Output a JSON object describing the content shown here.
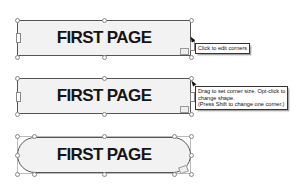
{
  "shapes": [
    {
      "label": "FIRST PAGE",
      "corner_style": "square",
      "state": "hover-corner-handle"
    },
    {
      "label": "FIRST PAGE",
      "corner_style": "square",
      "state": "dragging-corner"
    },
    {
      "label": "FIRST PAGE",
      "corner_style": "rounded",
      "state": "rounded-result"
    }
  ],
  "tooltips": {
    "first": "Click to edit corners",
    "second_lines": [
      "Drag to set corner size. Opt-click to",
      "change shape.",
      "(Press Shift to change one corner.)"
    ]
  },
  "icons": {
    "handle": "selection-handle-icon",
    "corner": "corner-edit-icon",
    "cursor": "arrow-cursor-icon"
  },
  "colors": {
    "shape_fill": "#f2f2f2",
    "shape_border": "#555555",
    "text": "#151515",
    "tooltip_bg": "#ffffff"
  }
}
